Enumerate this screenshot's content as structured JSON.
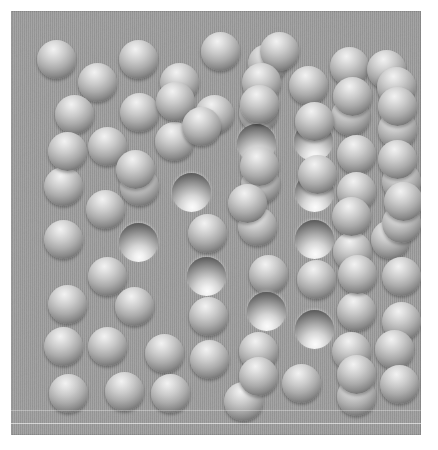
{
  "image": {
    "title": "Convexity / shape-from-shading illusion",
    "subject": "grid-of-shaded-circles",
    "width": 438,
    "height": 450
  },
  "canvas": {
    "background_color": "#ffffff"
  },
  "panel": {
    "x": 11,
    "y": 11,
    "width": 410,
    "height": 424,
    "background_color": "#9b9b9b",
    "edge_color": "#8e8e8e",
    "noise": true,
    "hairlines": [
      {
        "y": 399,
        "variant": "dim"
      },
      {
        "y": 412,
        "variant": "bright"
      }
    ]
  },
  "legend": {
    "bump_label": "convex bump (lit from above)",
    "bump_highlight_color": "#f2f2f2",
    "bump_shadow_color": "#525252",
    "dimple_label": "concave dimple (lit from above)",
    "dimple_highlight_color": "#fbfbfb",
    "dimple_shadow_color": "#3d3d3d"
  },
  "chart_data": {
    "type": "scatter",
    "xlabel": "",
    "ylabel": "",
    "xlim": [
      0,
      410
    ],
    "ylim": [
      0,
      424
    ],
    "grid": false,
    "legend_position": "none",
    "series": [
      {
        "name": "bump",
        "count": 69
      },
      {
        "name": "dimple",
        "count": 12
      }
    ]
  },
  "discs": [
    {
      "cx": 45,
      "cy": 48,
      "r": 19.5,
      "kind": "bump"
    },
    {
      "cx": 127,
      "cy": 48,
      "r": 19.5,
      "kind": "bump"
    },
    {
      "cx": 209,
      "cy": 40,
      "r": 19.5,
      "kind": "bump"
    },
    {
      "cx": 256,
      "cy": 52,
      "r": 19.5,
      "kind": "bump"
    },
    {
      "cx": 268,
      "cy": 40,
      "r": 19.5,
      "kind": "bump"
    },
    {
      "cx": 338,
      "cy": 55,
      "r": 19.5,
      "kind": "bump"
    },
    {
      "cx": 375,
      "cy": 58,
      "r": 19.5,
      "kind": "bump"
    },
    {
      "cx": 86,
      "cy": 71,
      "r": 19.5,
      "kind": "bump"
    },
    {
      "cx": 168,
      "cy": 71,
      "r": 19.5,
      "kind": "bump"
    },
    {
      "cx": 250,
      "cy": 71,
      "r": 19.5,
      "kind": "bump"
    },
    {
      "cx": 297,
      "cy": 74,
      "r": 19.5,
      "kind": "bump"
    },
    {
      "cx": 385,
      "cy": 75,
      "r": 19.5,
      "kind": "bump"
    },
    {
      "cx": 63,
      "cy": 103,
      "r": 19.5,
      "kind": "bump"
    },
    {
      "cx": 128,
      "cy": 101,
      "r": 19.5,
      "kind": "bump"
    },
    {
      "cx": 203,
      "cy": 103,
      "r": 19.5,
      "kind": "bump"
    },
    {
      "cx": 247,
      "cy": 101,
      "r": 19.5,
      "kind": "bump"
    },
    {
      "cx": 339,
      "cy": 105,
      "r": 19.5,
      "kind": "bump"
    },
    {
      "cx": 386,
      "cy": 118,
      "r": 19.5,
      "kind": "bump"
    },
    {
      "cx": 96,
      "cy": 135,
      "r": 19.5,
      "kind": "bump"
    },
    {
      "cx": 163,
      "cy": 130,
      "r": 19.5,
      "kind": "bump"
    },
    {
      "cx": 245,
      "cy": 132,
      "r": 19.5,
      "kind": "dimple"
    },
    {
      "cx": 302,
      "cy": 130,
      "r": 19.5,
      "kind": "dimple"
    },
    {
      "cx": 345,
      "cy": 143,
      "r": 19.5,
      "kind": "bump"
    },
    {
      "cx": 390,
      "cy": 170,
      "r": 19.5,
      "kind": "bump"
    },
    {
      "cx": 52,
      "cy": 175,
      "r": 19.5,
      "kind": "bump"
    },
    {
      "cx": 128,
      "cy": 175,
      "r": 19.5,
      "kind": "bump"
    },
    {
      "cx": 180,
      "cy": 181,
      "r": 19.5,
      "kind": "dimple"
    },
    {
      "cx": 249,
      "cy": 173,
      "r": 19.5,
      "kind": "bump"
    },
    {
      "cx": 303,
      "cy": 181,
      "r": 19.5,
      "kind": "dimple"
    },
    {
      "cx": 345,
      "cy": 180,
      "r": 19.5,
      "kind": "bump"
    },
    {
      "cx": 94,
      "cy": 198,
      "r": 19.5,
      "kind": "bump"
    },
    {
      "cx": 127,
      "cy": 231,
      "r": 19.5,
      "kind": "dimple"
    },
    {
      "cx": 196,
      "cy": 222,
      "r": 19.5,
      "kind": "bump"
    },
    {
      "cx": 246,
      "cy": 215,
      "r": 19.5,
      "kind": "bump"
    },
    {
      "cx": 303,
      "cy": 228,
      "r": 19.5,
      "kind": "dimple"
    },
    {
      "cx": 341,
      "cy": 240,
      "r": 19.5,
      "kind": "bump"
    },
    {
      "cx": 379,
      "cy": 228,
      "r": 19.5,
      "kind": "bump"
    },
    {
      "cx": 52,
      "cy": 228,
      "r": 19.5,
      "kind": "bump"
    },
    {
      "cx": 96,
      "cy": 265,
      "r": 19.5,
      "kind": "bump"
    },
    {
      "cx": 195,
      "cy": 265,
      "r": 19.5,
      "kind": "dimple"
    },
    {
      "cx": 257,
      "cy": 263,
      "r": 19.5,
      "kind": "bump"
    },
    {
      "cx": 305,
      "cy": 268,
      "r": 19.5,
      "kind": "bump"
    },
    {
      "cx": 390,
      "cy": 265,
      "r": 19.5,
      "kind": "bump"
    },
    {
      "cx": 56,
      "cy": 293,
      "r": 19.5,
      "kind": "bump"
    },
    {
      "cx": 123,
      "cy": 295,
      "r": 19.5,
      "kind": "bump"
    },
    {
      "cx": 197,
      "cy": 305,
      "r": 19.5,
      "kind": "bump"
    },
    {
      "cx": 255,
      "cy": 300,
      "r": 19.5,
      "kind": "dimple"
    },
    {
      "cx": 303,
      "cy": 318,
      "r": 19.5,
      "kind": "dimple"
    },
    {
      "cx": 345,
      "cy": 300,
      "r": 19.5,
      "kind": "bump"
    },
    {
      "cx": 390,
      "cy": 310,
      "r": 19.5,
      "kind": "bump"
    },
    {
      "cx": 52,
      "cy": 335,
      "r": 19.5,
      "kind": "bump"
    },
    {
      "cx": 96,
      "cy": 335,
      "r": 19.5,
      "kind": "bump"
    },
    {
      "cx": 153,
      "cy": 342,
      "r": 19.5,
      "kind": "bump"
    },
    {
      "cx": 198,
      "cy": 348,
      "r": 19.5,
      "kind": "bump"
    },
    {
      "cx": 247,
      "cy": 340,
      "r": 19.5,
      "kind": "bump"
    },
    {
      "cx": 340,
      "cy": 340,
      "r": 19.5,
      "kind": "bump"
    },
    {
      "cx": 383,
      "cy": 338,
      "r": 19.5,
      "kind": "bump"
    },
    {
      "cx": 57,
      "cy": 382,
      "r": 19.5,
      "kind": "bump"
    },
    {
      "cx": 113,
      "cy": 380,
      "r": 19.5,
      "kind": "bump"
    },
    {
      "cx": 159,
      "cy": 382,
      "r": 19.5,
      "kind": "bump"
    },
    {
      "cx": 232,
      "cy": 390,
      "r": 19.5,
      "kind": "bump"
    },
    {
      "cx": 290,
      "cy": 372,
      "r": 19.5,
      "kind": "bump"
    },
    {
      "cx": 345,
      "cy": 385,
      "r": 19.5,
      "kind": "bump"
    },
    {
      "cx": 388,
      "cy": 373,
      "r": 19.5,
      "kind": "bump"
    },
    {
      "cx": 306,
      "cy": 163,
      "r": 19.5,
      "kind": "bump"
    },
    {
      "cx": 248,
      "cy": 155,
      "r": 19.5,
      "kind": "bump"
    },
    {
      "cx": 390,
      "cy": 212,
      "r": 19.5,
      "kind": "bump"
    },
    {
      "cx": 340,
      "cy": 205,
      "r": 19.5,
      "kind": "bump"
    },
    {
      "cx": 56,
      "cy": 140,
      "r": 19.5,
      "kind": "bump"
    },
    {
      "cx": 124,
      "cy": 158,
      "r": 19.5,
      "kind": "bump"
    },
    {
      "cx": 164,
      "cy": 90,
      "r": 19.5,
      "kind": "bump"
    },
    {
      "cx": 303,
      "cy": 110,
      "r": 19.5,
      "kind": "bump"
    },
    {
      "cx": 341,
      "cy": 85,
      "r": 19.5,
      "kind": "bump"
    },
    {
      "cx": 386,
      "cy": 95,
      "r": 19.5,
      "kind": "bump"
    },
    {
      "cx": 248,
      "cy": 93,
      "r": 19.5,
      "kind": "bump"
    },
    {
      "cx": 190,
      "cy": 115,
      "r": 19.5,
      "kind": "bump"
    },
    {
      "cx": 236,
      "cy": 192,
      "r": 19.5,
      "kind": "bump"
    },
    {
      "cx": 386,
      "cy": 148,
      "r": 19.5,
      "kind": "bump"
    },
    {
      "cx": 392,
      "cy": 190,
      "r": 19.5,
      "kind": "bump"
    },
    {
      "cx": 346,
      "cy": 263,
      "r": 19.5,
      "kind": "bump"
    },
    {
      "cx": 247,
      "cy": 365,
      "r": 19.5,
      "kind": "bump"
    },
    {
      "cx": 345,
      "cy": 363,
      "r": 19.5,
      "kind": "bump"
    }
  ]
}
